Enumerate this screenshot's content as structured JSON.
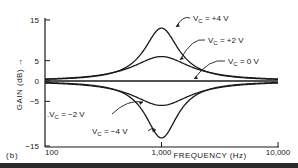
{
  "figure_label": "(b)",
  "chart_data": {
    "type": "line",
    "title": "",
    "xlabel": "FREQUENCY (Hz)",
    "ylabel": "GAIN (dB) →",
    "xscale": "log",
    "xlim": [
      100,
      10000
    ],
    "ylim": [
      -15,
      15
    ],
    "x_ticks": [
      {
        "value": 100,
        "label": "100"
      },
      {
        "value": 1000,
        "label": "1,000"
      },
      {
        "value": 10000,
        "label": "10,000"
      }
    ],
    "y_ticks": [
      {
        "value": 15,
        "label": "15"
      },
      {
        "value": 5,
        "label": "5"
      },
      {
        "value": 0,
        "label": "0"
      },
      {
        "value": -5,
        "label": "−5"
      },
      {
        "value": -15,
        "label": "−15"
      }
    ],
    "grid": false,
    "x": [
      100,
      200,
      300,
      500,
      700,
      1000,
      1400,
      2000,
      3000,
      5000,
      10000
    ],
    "series": [
      {
        "name": "V_C = +4 V",
        "label": "V",
        "sub": "C",
        "suffix": " = +4 V",
        "values": [
          0,
          0.8,
          2.0,
          5.5,
          10.0,
          13.0,
          9.5,
          4.5,
          1.5,
          0.3,
          0
        ]
      },
      {
        "name": "V_C = +2 V",
        "label": "V",
        "sub": "C",
        "suffix": " = +2 V",
        "values": [
          0,
          0.5,
          1.3,
          3.5,
          5.3,
          6.0,
          5.0,
          3.0,
          1.0,
          0.2,
          0
        ]
      },
      {
        "name": "V_C = 0 V",
        "label": "V",
        "sub": "C",
        "suffix": " = 0 V",
        "values": [
          0,
          0,
          0,
          0,
          0,
          0,
          0,
          0,
          0,
          0,
          0
        ]
      },
      {
        "name": "V_C = −2 V",
        "label": ".V",
        "sub": "C",
        "suffix": " = −2 V",
        "values": [
          0,
          -0.5,
          -1.3,
          -3.5,
          -5.3,
          -6.0,
          -5.0,
          -3.0,
          -1.0,
          -0.2,
          0
        ]
      },
      {
        "name": "V_C = −4 V",
        "label": "V",
        "sub": "C",
        "suffix": " = −4 V",
        "values": [
          0,
          -0.8,
          -2.0,
          -5.5,
          -10.5,
          -14.0,
          -10.0,
          -4.5,
          -1.5,
          -0.3,
          0
        ]
      }
    ],
    "legend_position": "inline annotations with arrows"
  }
}
